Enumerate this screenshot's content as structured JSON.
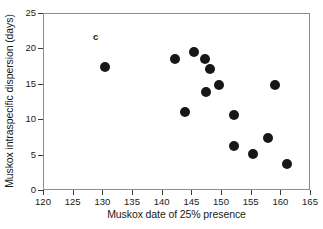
{
  "figure": {
    "panel_letter": "c"
  },
  "chart_data": {
    "type": "scatter",
    "title": "",
    "xlabel": "Muskox date of 25% presence",
    "ylabel": "Muskox intraspecific dispersion (days)",
    "xlim": [
      120,
      165
    ],
    "ylim": [
      0,
      25
    ],
    "xticks": [
      120,
      125,
      130,
      135,
      140,
      145,
      150,
      155,
      160,
      165
    ],
    "yticks": [
      0,
      5,
      10,
      15,
      20,
      25
    ],
    "grid": false,
    "legend": null,
    "marker": {
      "shape": "circle",
      "color": "#171717",
      "size_px": 10
    },
    "series": [
      {
        "name": "Muskox populations",
        "points": [
          {
            "x": 130.2,
            "y": 17.5
          },
          {
            "x": 142.0,
            "y": 18.6
          },
          {
            "x": 143.8,
            "y": 11.2
          },
          {
            "x": 145.3,
            "y": 19.7
          },
          {
            "x": 147.2,
            "y": 18.6
          },
          {
            "x": 147.3,
            "y": 14.0
          },
          {
            "x": 148.0,
            "y": 17.2
          },
          {
            "x": 149.5,
            "y": 15.0
          },
          {
            "x": 152.0,
            "y": 10.8
          },
          {
            "x": 152.1,
            "y": 6.3
          },
          {
            "x": 155.2,
            "y": 5.2
          },
          {
            "x": 157.7,
            "y": 7.5
          },
          {
            "x": 159.0,
            "y": 15.0
          },
          {
            "x": 161.0,
            "y": 3.8
          }
        ]
      }
    ]
  }
}
